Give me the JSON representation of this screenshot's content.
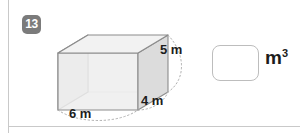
{
  "problem": {
    "number": "13",
    "unit_base": "m",
    "unit_exponent": "3"
  },
  "figure": {
    "shape": "rectangular-prism",
    "labels": {
      "height": "5 m",
      "depth": "4 m",
      "width": "6 m"
    },
    "colors": {
      "top_face": "#f2f2f2",
      "left_face": "#e4e4e4",
      "front_face": "#ededed",
      "right_face": "#dcdcdc",
      "edge": "#8c8c8c",
      "hidden_edge": "#bbbbbb",
      "dim_arc": "#b8b8b8"
    }
  },
  "answer": {
    "value": "",
    "placeholder": ""
  },
  "page": {
    "rule_color": "#c9c9c9",
    "badge_color": "#7b7b7b"
  }
}
